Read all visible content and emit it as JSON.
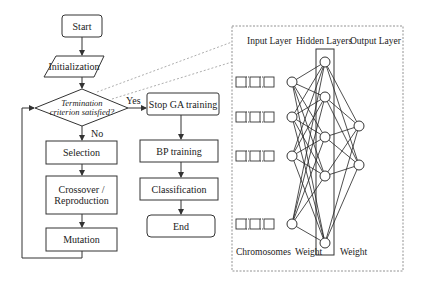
{
  "flowchart": {
    "start": "Start",
    "initialization": "Initialization",
    "decision_line1": "Termination",
    "decision_line2": "criterion satisfied?",
    "yes_label": "Yes",
    "no_label": "No",
    "selection": "Selection",
    "crossover_line1": "Crossover /",
    "crossover_line2": "Reproduction",
    "mutation": "Mutation",
    "stop_ga": "Stop GA training",
    "bp_training": "BP training",
    "classification": "Classification",
    "end": "End"
  },
  "network": {
    "input_layer_label": "Input Layer",
    "hidden_layers_label": "Hidden Layers",
    "output_layer_label": "Output Layer",
    "chromosomes_label": "Chromosomes",
    "weight_label_1": "Weight",
    "weight_label_2": "Weight",
    "input_rows": 4,
    "input_nodes_y": [
      82,
      117,
      156,
      224
    ],
    "hidden_nodes_y": [
      62,
      97,
      137,
      176,
      243
    ],
    "output_nodes_y": [
      126,
      165
    ]
  },
  "colors": {
    "stroke": "#333333",
    "dotted": "#777777",
    "background": "#ffffff"
  }
}
